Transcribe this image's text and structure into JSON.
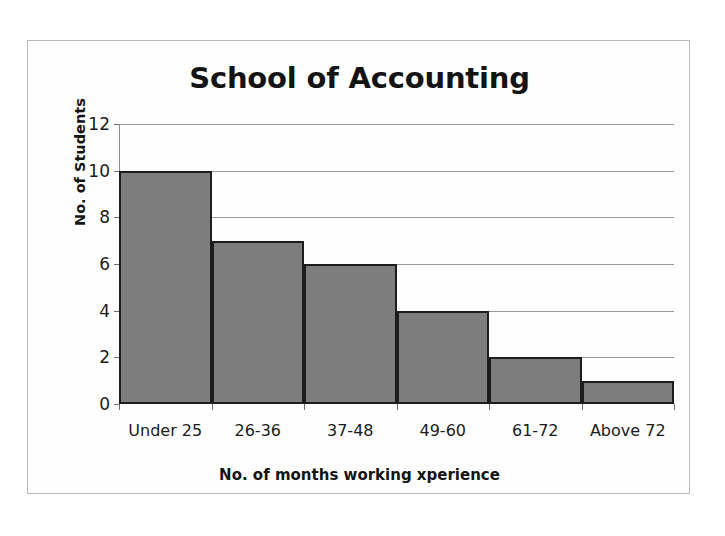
{
  "chart_data": {
    "type": "bar",
    "title": "School of Accounting",
    "xlabel": "No. of months working xperience",
    "ylabel": "No. of Students",
    "categories": [
      "Under 25",
      "26-36",
      "37-48",
      "49-60",
      "61-72",
      "Above 72"
    ],
    "values": [
      10,
      7,
      6,
      4,
      2,
      1
    ],
    "ylim": [
      0,
      12
    ],
    "ytick_labels": [
      "0",
      "2",
      "4",
      "6",
      "8",
      "10",
      "12"
    ],
    "ytick_values": [
      0,
      2,
      4,
      6,
      8,
      10,
      12
    ],
    "grid": "horizontal",
    "legend": "none",
    "bar_gap": 0,
    "colors": {
      "bar_fill": "#7d7d7d",
      "bar_border": "#1c1c1c",
      "gridline": "#9a9a9a",
      "axis": "#6f6f6f",
      "text": "#1b1b1b",
      "frame": "#b9b9b9",
      "background": "#ffffff"
    }
  }
}
